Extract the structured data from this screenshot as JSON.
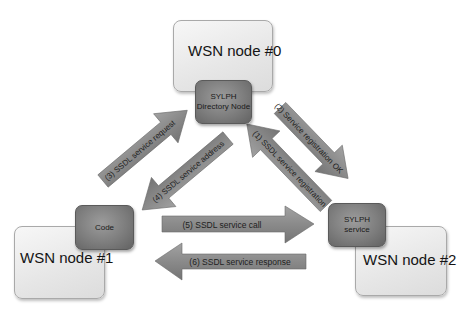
{
  "diagram": {
    "nodes": {
      "wsn0": {
        "label": "WSN node #0"
      },
      "wsn1": {
        "label": "WSN node #1"
      },
      "wsn2": {
        "label": "WSN node #2"
      },
      "directory": {
        "line1": "SYLPH",
        "line2": "Directory Node"
      },
      "code": {
        "label": "Code"
      },
      "service": {
        "line1": "SYLPH",
        "line2": "service"
      }
    },
    "arrows": [
      {
        "id": "1",
        "label": "(1) SSDL service registration",
        "from": "SYLPH service",
        "to": "SYLPH Directory Node"
      },
      {
        "id": "2",
        "label": "(2) Service registration OK",
        "from": "SYLPH Directory Node",
        "to": "SYLPH service"
      },
      {
        "id": "3",
        "label": "(3) SSDL service request",
        "from": "Code",
        "to": "SYLPH Directory Node"
      },
      {
        "id": "4",
        "label": "(4) SSDL service address",
        "from": "SYLPH Directory Node",
        "to": "Code"
      },
      {
        "id": "5",
        "label": "(5) SSDL service call",
        "from": "Code",
        "to": "SYLPH service"
      },
      {
        "id": "6",
        "label": "(6) SSDL service response",
        "from": "SYLPH service",
        "to": "Code"
      }
    ],
    "colors": {
      "arrow_fill": "#8a8a8a",
      "node_dark": "#7d7d7d",
      "node_light": "#e8e8e8"
    }
  }
}
